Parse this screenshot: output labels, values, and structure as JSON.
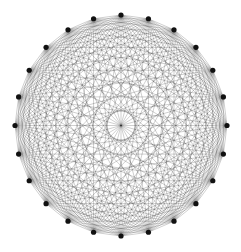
{
  "diagram": {
    "type": "complete-graph",
    "vertex_count": 24,
    "layout": "circular",
    "center": [
      121,
      125.5
    ],
    "radius_x": 106,
    "radius_y": 110.5,
    "edge_color": "#000000",
    "edge_opacity": 0.55,
    "edge_width": 0.35,
    "vertex_color": "#111111",
    "vertex_radius": 2.6,
    "background": "#ffffff"
  }
}
